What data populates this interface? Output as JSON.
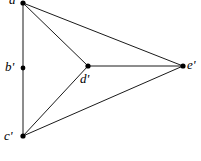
{
  "figure": {
    "type": "geometric-point-diagram",
    "width": 201,
    "height": 161,
    "background_color": "#ffffff",
    "line_color": "#1a1a1a",
    "dot_color": "#000000",
    "label_color": "#000000"
  },
  "vertices": [
    {
      "id": "a",
      "label": "a'",
      "x": 23,
      "y": 3,
      "label_x": 9,
      "label_y": -7,
      "dot_radius": 2.6
    },
    {
      "id": "b",
      "label": "b'",
      "x": 23,
      "y": 68,
      "label_x": 5,
      "label_y": 60,
      "dot_radius": 2.4
    },
    {
      "id": "c",
      "label": "c'",
      "x": 23,
      "y": 136,
      "label_x": 4,
      "label_y": 129,
      "dot_radius": 2.6
    },
    {
      "id": "d",
      "label": "d'",
      "x": 88,
      "y": 66,
      "label_x": 80,
      "label_y": 72,
      "dot_radius": 2.6
    },
    {
      "id": "e",
      "label": "e'",
      "x": 183,
      "y": 66,
      "label_x": 187,
      "label_y": 58,
      "dot_radius": 2.6
    }
  ],
  "edges": [
    {
      "id": "a-c",
      "from": "a",
      "to": "c",
      "x1": 23,
      "y1": 3,
      "x2": 23,
      "y2": 136
    },
    {
      "id": "a-d",
      "from": "a",
      "to": "d",
      "x1": 23,
      "y1": 3,
      "x2": 88,
      "y2": 66
    },
    {
      "id": "a-e",
      "from": "a",
      "to": "e",
      "x1": 23,
      "y1": 3,
      "x2": 183,
      "y2": 66
    },
    {
      "id": "c-d",
      "from": "c",
      "to": "d",
      "x1": 23,
      "y1": 136,
      "x2": 88,
      "y2": 66
    },
    {
      "id": "c-e",
      "from": "c",
      "to": "e",
      "x1": 23,
      "y1": 136,
      "x2": 183,
      "y2": 66
    },
    {
      "id": "d-e",
      "from": "d",
      "to": "e",
      "x1": 88,
      "y1": 66,
      "x2": 183,
      "y2": 66
    }
  ]
}
